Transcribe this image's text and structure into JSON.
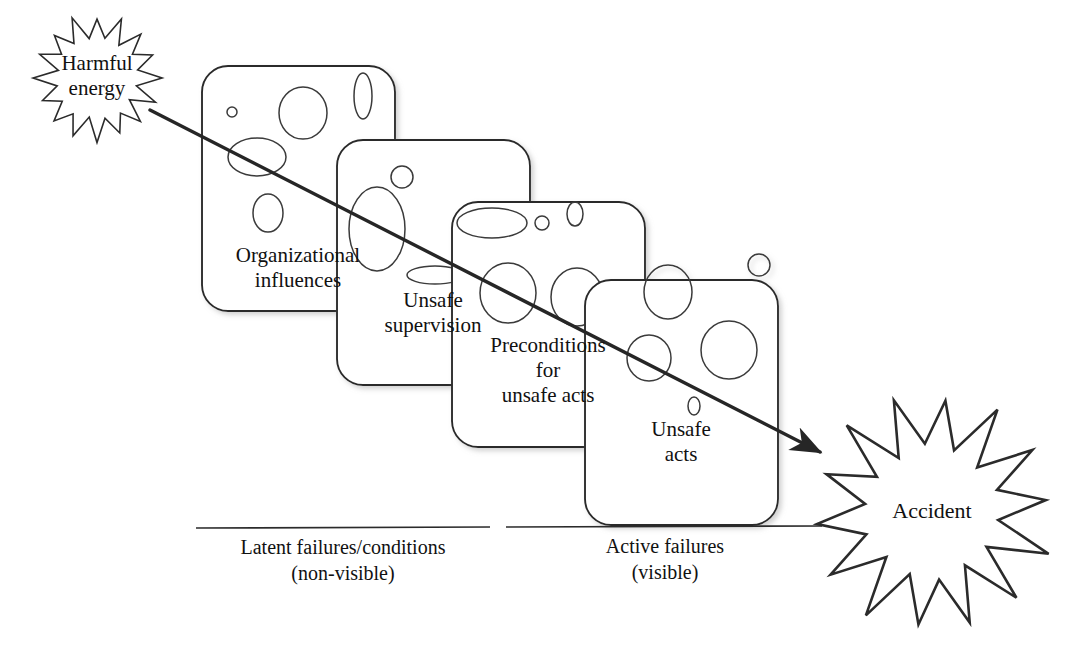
{
  "figure": {
    "kind": "swiss-cheese-model-diagram",
    "background_color": "#ffffff",
    "stroke_color": "#2b2b2b",
    "hole_stroke_color": "#3a3a3a",
    "arrow_color": "#262626",
    "card_fill": "#ffffff",
    "shadow_color": "#9a9a9a"
  },
  "source_burst": {
    "label": "Harmful\nenergy",
    "points": 16,
    "center": [
      97,
      78
    ],
    "outer_radius": 62,
    "inner_radius": 41,
    "font_size": 21
  },
  "outcome_burst": {
    "label": "Accident",
    "points": 14,
    "center": [
      932,
      512
    ],
    "outer_radius": 118,
    "inner_radius": 66,
    "font_size": 22
  },
  "trajectory_arrow": {
    "name": "accident-trajectory-arrow",
    "start": [
      150,
      110
    ],
    "end": [
      820,
      452
    ],
    "stroke_width": 3.4,
    "arrowhead": "filled-triangle"
  },
  "layers": [
    {
      "id": "organizational-influences",
      "label": "Organizational\ninfluences",
      "rect": [
        202,
        66,
        193,
        245
      ],
      "radius": 26,
      "label_box": [
        198,
        243,
        200
      ],
      "label_font_size": 21,
      "holes": [
        {
          "cx": 232,
          "cy": 112,
          "rx": 5,
          "ry": 5
        },
        {
          "cx": 303,
          "cy": 113,
          "rx": 24,
          "ry": 26
        },
        {
          "cx": 363,
          "cy": 96,
          "rx": 9,
          "ry": 23
        },
        {
          "cx": 257,
          "cy": 157,
          "rx": 29,
          "ry": 19
        },
        {
          "cx": 268,
          "cy": 213,
          "rx": 15,
          "ry": 19
        }
      ]
    },
    {
      "id": "unsafe-supervision",
      "label": "Unsafe\nsupervision",
      "rect": [
        337,
        140,
        193,
        245
      ],
      "radius": 26,
      "label_box": [
        333,
        288,
        200
      ],
      "label_font_size": 21,
      "holes": [
        {
          "cx": 402,
          "cy": 177,
          "rx": 11,
          "ry": 11
        },
        {
          "cx": 377,
          "cy": 229,
          "rx": 28,
          "ry": 42
        },
        {
          "cx": 435,
          "cy": 275,
          "rx": 28,
          "ry": 9
        }
      ]
    },
    {
      "id": "preconditions-for-unsafe-acts",
      "label": "Preconditions\nfor\nunsafe acts",
      "rect": [
        452,
        202,
        193,
        245
      ],
      "radius": 26,
      "label_box": [
        448,
        333,
        200
      ],
      "label_font_size": 21,
      "holes": [
        {
          "cx": 492,
          "cy": 223,
          "rx": 35,
          "ry": 15
        },
        {
          "cx": 542,
          "cy": 223,
          "rx": 7,
          "ry": 7
        },
        {
          "cx": 575,
          "cy": 214,
          "rx": 8,
          "ry": 12
        },
        {
          "cx": 508,
          "cy": 293,
          "rx": 28,
          "ry": 30
        },
        {
          "cx": 577,
          "cy": 297,
          "rx": 26,
          "ry": 29
        }
      ]
    },
    {
      "id": "unsafe-acts",
      "label": "Unsafe\nacts",
      "rect": [
        585,
        280,
        193,
        245
      ],
      "radius": 26,
      "label_box": [
        581,
        417,
        200
      ],
      "label_font_size": 21,
      "holes": [
        {
          "cx": 759,
          "cy": 265,
          "rx": 11,
          "ry": 11
        },
        {
          "cx": 668,
          "cy": 292,
          "rx": 24,
          "ry": 27
        },
        {
          "cx": 729,
          "cy": 350,
          "rx": 28,
          "ry": 29
        },
        {
          "cx": 649,
          "cy": 358,
          "rx": 22,
          "ry": 23
        },
        {
          "cx": 694,
          "cy": 406,
          "rx": 6,
          "ry": 9
        }
      ]
    }
  ],
  "captions": [
    {
      "id": "latent-failures",
      "label": "Latent failures/conditions\n(non-visible)",
      "rule": [
        196,
        528,
        490
      ],
      "text_box": [
        190,
        534,
        306
      ],
      "font_size": 20
    },
    {
      "id": "active-failures",
      "label": "Active failures\n(visible)",
      "rule": [
        506,
        527,
        822
      ],
      "text_box": [
        560,
        533,
        210
      ],
      "font_size": 20
    }
  ]
}
